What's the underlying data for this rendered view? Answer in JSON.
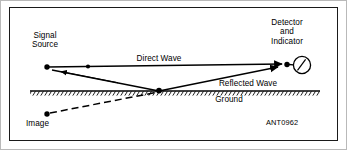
{
  "figure": {
    "id_code": "ANT0962",
    "background_color": "#ffffff",
    "line_color": "#000000",
    "frame_color": "#1a1a1a"
  },
  "labels": {
    "signal_source": "Signal\nSource",
    "detector": "Detector\nand\nIndicator",
    "direct_wave": "Direct Wave",
    "reflected_wave": "Reflected Wave",
    "ground": "Ground",
    "image": "Image"
  },
  "nodes": {
    "signal_source_point": {
      "x": 47,
      "y": 67
    },
    "detector_point": {
      "x": 285,
      "y": 64
    },
    "reflection_point": {
      "x": 159,
      "y": 91
    },
    "image_point": {
      "x": 47,
      "y": 114
    },
    "meter_center": {
      "x": 302,
      "y": 65
    },
    "meter_radius": 9
  },
  "rays": [
    {
      "name": "direct-wave-ray",
      "style": "solid",
      "from": "signal_source_point",
      "to": "detector_point",
      "arrow": "forward",
      "label": "Direct Wave"
    },
    {
      "name": "incident-wave-ray",
      "style": "solid",
      "from": "signal_source_point",
      "to": "reflection_point",
      "arrow": "backward"
    },
    {
      "name": "reflected-wave-ray",
      "style": "solid",
      "from": "reflection_point",
      "to": "detector_point",
      "arrow": "forward",
      "label": "Reflected Wave"
    },
    {
      "name": "image-ray",
      "style": "dashed",
      "from": "image_point",
      "to": "reflection_point",
      "arrow": "none"
    }
  ],
  "ground": {
    "line_y": 91,
    "x_start": 30,
    "x_end": 320,
    "hatching": "diagonal-below"
  }
}
